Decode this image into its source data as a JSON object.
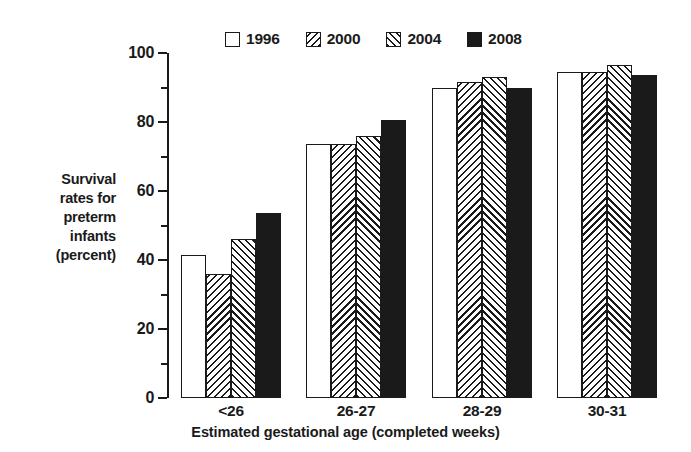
{
  "chart_data": {
    "type": "bar",
    "title": "",
    "subtitle": "",
    "categories": [
      "<26",
      "26-27",
      "28-29",
      "30-31"
    ],
    "series": [
      {
        "name": "1996",
        "pattern": "empty",
        "values": [
          41.5,
          73.5,
          90.0,
          94.5
        ]
      },
      {
        "name": "2000",
        "pattern": "backslash",
        "values": [
          36.0,
          73.5,
          91.5,
          94.5
        ]
      },
      {
        "name": "2004",
        "pattern": "slash",
        "values": [
          46.0,
          76.0,
          93.0,
          96.5
        ]
      },
      {
        "name": "2008",
        "pattern": "solid",
        "values": [
          53.5,
          80.5,
          90.0,
          93.5
        ]
      }
    ],
    "xlabel": "Estimated gestational age (completed weeks)",
    "ylabel": "Survival rates for preterm infants (percent)",
    "ylim": [
      0,
      100
    ],
    "ytick_major": [
      0,
      20,
      40,
      60,
      80,
      100
    ],
    "ytick_minor": [
      10,
      30,
      50,
      70,
      90
    ],
    "ytick_labels": [
      "0",
      "20",
      "40",
      "60",
      "80",
      "100"
    ],
    "grid": false,
    "legend_position": "top-center",
    "colors": {
      "ink": "#1a1a1a",
      "background": "#ffffff"
    }
  },
  "ylabel_lines": [
    "Survival",
    "rates for",
    "preterm",
    "infants",
    "(percent)"
  ],
  "legend": {
    "items": [
      {
        "label": "1996",
        "pattern": "empty"
      },
      {
        "label": "2000",
        "pattern": "backslash"
      },
      {
        "label": "2004",
        "pattern": "slash"
      },
      {
        "label": "2008",
        "pattern": "solid"
      }
    ]
  },
  "axis": {
    "x_title": "Estimated gestational age (completed weeks)"
  }
}
